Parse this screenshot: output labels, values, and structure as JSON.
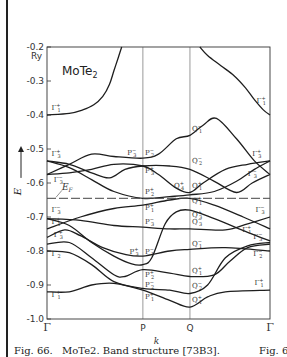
{
  "chart_data": {
    "type": "line",
    "title": "MoTe2",
    "title_main": "MoTe",
    "title_sub": "2",
    "xlabel": "k",
    "ylabel": "E",
    "yunit": "Ry",
    "ylim": [
      -1.0,
      -0.2
    ],
    "yticks": [
      -0.2,
      -0.3,
      -0.4,
      -0.5,
      -0.6,
      -0.7,
      -0.8,
      -0.9,
      -1.0
    ],
    "ytick_labels": [
      "-0.2",
      "-0.3",
      "-0.4",
      "-0.5",
      "-0.6",
      "-0.7",
      "-0.8",
      "-0.9",
      "-1.0"
    ],
    "x_symmetry_points": [
      {
        "label": "Γ",
        "k": 0.0
      },
      {
        "label": "P",
        "k": 0.43
      },
      {
        "label": "Q",
        "k": 0.641
      },
      {
        "label": "Γ",
        "k": 1.0
      }
    ],
    "fermi_level": {
      "label": "EF",
      "label_main": "E",
      "label_sub": "F",
      "E": -0.645
    },
    "grid": false,
    "legend": null,
    "series": [
      {
        "name": "band-upper-left",
        "points": [
          [
            0,
            -0.4
          ],
          [
            0.1,
            -0.395
          ],
          [
            0.16,
            -0.385
          ],
          [
            0.21,
            -0.37
          ],
          [
            0.25,
            -0.345
          ],
          [
            0.28,
            -0.31
          ],
          [
            0.3,
            -0.27
          ],
          [
            0.32,
            -0.23
          ],
          [
            0.335,
            -0.2
          ]
        ]
      },
      {
        "name": "band-upper-right",
        "points": [
          [
            0.685,
            -0.2
          ],
          [
            0.72,
            -0.225
          ],
          [
            0.78,
            -0.255
          ],
          [
            0.84,
            -0.285
          ],
          [
            0.89,
            -0.32
          ],
          [
            0.93,
            -0.355
          ],
          [
            0.97,
            -0.385
          ],
          [
            1.0,
            -0.4
          ]
        ]
      },
      {
        "name": "band-1",
        "points": [
          [
            0,
            -0.575
          ],
          [
            0.1,
            -0.545
          ],
          [
            0.2,
            -0.515
          ],
          [
            0.3,
            -0.522
          ],
          [
            0.43,
            -0.527
          ],
          [
            0.5,
            -0.515
          ],
          [
            0.58,
            -0.47
          ],
          [
            0.641,
            -0.46
          ],
          [
            0.7,
            -0.43
          ],
          [
            0.76,
            -0.41
          ],
          [
            0.85,
            -0.47
          ],
          [
            0.93,
            -0.535
          ],
          [
            1.0,
            -0.575
          ]
        ]
      },
      {
        "name": "band-2",
        "points": [
          [
            0,
            -0.535
          ],
          [
            0.1,
            -0.545
          ],
          [
            0.2,
            -0.57
          ],
          [
            0.28,
            -0.585
          ],
          [
            0.35,
            -0.56
          ],
          [
            0.43,
            -0.55
          ],
          [
            0.55,
            -0.55
          ],
          [
            0.641,
            -0.56
          ],
          [
            0.75,
            -0.595
          ],
          [
            0.85,
            -0.628
          ],
          [
            0.92,
            -0.6
          ],
          [
            1.0,
            -0.575
          ]
        ]
      },
      {
        "name": "band-3",
        "points": [
          [
            0,
            -0.535
          ],
          [
            0.1,
            -0.555
          ],
          [
            0.2,
            -0.59
          ],
          [
            0.3,
            -0.625
          ],
          [
            0.43,
            -0.645
          ],
          [
            0.55,
            -0.64
          ],
          [
            0.641,
            -0.635
          ],
          [
            0.75,
            -0.625
          ],
          [
            0.85,
            -0.595
          ],
          [
            0.93,
            -0.56
          ],
          [
            1.0,
            -0.535
          ]
        ]
      },
      {
        "name": "band-4",
        "points": [
          [
            0,
            -0.575
          ],
          [
            0.1,
            -0.57
          ],
          [
            0.2,
            -0.56
          ],
          [
            0.3,
            -0.545
          ],
          [
            0.43,
            -0.55
          ],
          [
            0.5,
            -0.575
          ],
          [
            0.58,
            -0.615
          ],
          [
            0.641,
            -0.628
          ],
          [
            0.7,
            -0.6
          ],
          [
            0.8,
            -0.56
          ],
          [
            0.9,
            -0.545
          ],
          [
            1.0,
            -0.535
          ]
        ]
      },
      {
        "name": "band-5",
        "points": [
          [
            0,
            -0.735
          ],
          [
            0.15,
            -0.7
          ],
          [
            0.3,
            -0.675
          ],
          [
            0.43,
            -0.665
          ],
          [
            0.55,
            -0.65
          ],
          [
            0.641,
            -0.645
          ],
          [
            0.75,
            -0.665
          ],
          [
            0.88,
            -0.7
          ],
          [
            1.0,
            -0.735
          ]
        ]
      },
      {
        "name": "band-6",
        "points": [
          [
            0,
            -0.705
          ],
          [
            0.15,
            -0.71
          ],
          [
            0.3,
            -0.725
          ],
          [
            0.43,
            -0.73
          ],
          [
            0.55,
            -0.735
          ],
          [
            0.641,
            -0.735
          ],
          [
            0.8,
            -0.738
          ],
          [
            0.9,
            -0.72
          ],
          [
            1.0,
            -0.7
          ]
        ]
      },
      {
        "name": "band-7",
        "points": [
          [
            0,
            -0.705
          ],
          [
            0.1,
            -0.725
          ],
          [
            0.2,
            -0.775
          ],
          [
            0.3,
            -0.815
          ],
          [
            0.38,
            -0.838
          ],
          [
            0.43,
            -0.84
          ],
          [
            0.47,
            -0.82
          ],
          [
            0.53,
            -0.72
          ],
          [
            0.58,
            -0.685
          ],
          [
            0.641,
            -0.68
          ],
          [
            0.75,
            -0.705
          ],
          [
            0.9,
            -0.745
          ],
          [
            1.0,
            -0.77
          ]
        ]
      },
      {
        "name": "band-8",
        "points": [
          [
            0,
            -0.76
          ],
          [
            0.08,
            -0.738
          ],
          [
            0.15,
            -0.755
          ],
          [
            0.25,
            -0.79
          ],
          [
            0.35,
            -0.81
          ],
          [
            0.43,
            -0.815
          ],
          [
            0.55,
            -0.8
          ],
          [
            0.641,
            -0.795
          ],
          [
            0.8,
            -0.79
          ],
          [
            1.0,
            -0.8
          ]
        ]
      },
      {
        "name": "band-9",
        "points": [
          [
            0,
            -0.78
          ],
          [
            0.1,
            -0.775
          ],
          [
            0.2,
            -0.82
          ],
          [
            0.3,
            -0.87
          ],
          [
            0.35,
            -0.875
          ],
          [
            0.43,
            -0.855
          ],
          [
            0.55,
            -0.865
          ],
          [
            0.641,
            -0.875
          ],
          [
            0.75,
            -0.87
          ],
          [
            0.82,
            -0.83
          ],
          [
            0.9,
            -0.79
          ],
          [
            1.0,
            -0.78
          ]
        ]
      },
      {
        "name": "band-10",
        "points": [
          [
            0,
            -0.8
          ],
          [
            0.1,
            -0.805
          ],
          [
            0.2,
            -0.84
          ],
          [
            0.3,
            -0.89
          ],
          [
            0.43,
            -0.91
          ],
          [
            0.55,
            -0.915
          ],
          [
            0.641,
            -0.925
          ],
          [
            0.72,
            -0.9
          ],
          [
            0.8,
            -0.82
          ],
          [
            0.9,
            -0.785
          ],
          [
            1.0,
            -0.775
          ]
        ]
      },
      {
        "name": "band-11",
        "points": [
          [
            0,
            -0.92
          ],
          [
            0.1,
            -0.92
          ],
          [
            0.2,
            -0.9
          ],
          [
            0.3,
            -0.895
          ],
          [
            0.43,
            -0.915
          ],
          [
            0.55,
            -0.945
          ],
          [
            0.641,
            -0.965
          ],
          [
            0.72,
            -0.935
          ],
          [
            0.8,
            -0.92
          ],
          [
            1.0,
            -0.915
          ]
        ]
      }
    ],
    "annotations": [
      {
        "sym": "Γ",
        "sub": "1",
        "sup": "+",
        "k": 0.02,
        "E": -0.385
      },
      {
        "sym": "Γ",
        "sub": "1",
        "sup": "+",
        "k": 0.94,
        "E": -0.365
      },
      {
        "sym": "Γ",
        "sub": "3",
        "sup": "+",
        "k": 0.02,
        "E": -0.522
      },
      {
        "sym": "Γ",
        "sub": "3",
        "sup": "−",
        "k": 0.03,
        "E": -0.598
      },
      {
        "sym": "Γ",
        "sub": "3",
        "sup": "+",
        "k": 0.92,
        "E": -0.522
      },
      {
        "sym": "Γ",
        "sub": "3",
        "sup": "−",
        "k": 0.9,
        "E": -0.58
      },
      {
        "sym": "P",
        "sub": "3",
        "sup": "−",
        "k": 0.36,
        "E": -0.518
      },
      {
        "sym": "P",
        "sub": "2",
        "sup": "−",
        "k": 0.44,
        "E": -0.518
      },
      {
        "sym": "P",
        "sub": "3",
        "sup": "+",
        "k": 0.44,
        "E": -0.57
      },
      {
        "sym": "P",
        "sub": "2",
        "sup": "+",
        "k": 0.44,
        "E": -0.633
      },
      {
        "sym": "Q",
        "sub": "1",
        "sup": "−",
        "k": 0.65,
        "E": -0.448
      },
      {
        "sym": "Q",
        "sub": "2",
        "sup": "−",
        "k": 0.65,
        "E": -0.54
      },
      {
        "sym": "Q",
        "sub": "4",
        "sup": "+",
        "k": 0.57,
        "E": -0.615
      },
      {
        "sym": "Q",
        "sub": "1",
        "sup": "+",
        "k": 0.65,
        "E": -0.615
      },
      {
        "sym": "Γ",
        "sub": "3",
        "sup": "−",
        "k": 0.02,
        "E": -0.685
      },
      {
        "sym": "Γ",
        "sub": "1",
        "sup": "+",
        "k": 0.02,
        "E": -0.722
      },
      {
        "sym": "Γ",
        "sub": "3",
        "sup": "+",
        "k": 0.03,
        "E": -0.758
      },
      {
        "sym": "Γ",
        "sub": "2",
        "sup": "−",
        "k": 0.02,
        "E": -0.815
      },
      {
        "sym": "Γ",
        "sub": "1",
        "sup": "+",
        "k": 0.02,
        "E": -0.935
      },
      {
        "sym": "P",
        "sub": "1",
        "sup": "+",
        "k": 0.44,
        "E": -0.68
      },
      {
        "sym": "P",
        "sub": "3",
        "sup": "−",
        "k": 0.44,
        "E": -0.722
      },
      {
        "sym": "P",
        "sub": "3",
        "sup": "+",
        "k": 0.37,
        "E": -0.81
      },
      {
        "sym": "P",
        "sub": "1",
        "sup": "−",
        "k": 0.44,
        "E": -0.81
      },
      {
        "sym": "P",
        "sub": "2",
        "sup": "+",
        "k": 0.44,
        "E": -0.875
      },
      {
        "sym": "P",
        "sub": "2",
        "sup": "−",
        "k": 0.44,
        "E": -0.905
      },
      {
        "sym": "P",
        "sub": "1",
        "sup": "+",
        "k": 0.44,
        "E": -0.94
      },
      {
        "sym": "Q",
        "sub": "1",
        "sup": "+",
        "k": 0.65,
        "E": -0.66
      },
      {
        "sym": "Q",
        "sub": "3",
        "sup": "+",
        "k": 0.65,
        "E": -0.7
      },
      {
        "sym": "Q",
        "sub": "3",
        "sup": "−",
        "k": 0.65,
        "E": -0.72
      },
      {
        "sym": "Q",
        "sub": "1",
        "sup": "−",
        "k": 0.65,
        "E": -0.785
      },
      {
        "sym": "Q",
        "sub": "1",
        "sup": "+",
        "k": 0.65,
        "E": -0.865
      },
      {
        "sym": "Q",
        "sub": "2",
        "sup": "−",
        "k": 0.65,
        "E": -0.91
      },
      {
        "sym": "Q",
        "sub": "1",
        "sup": "+",
        "k": 0.65,
        "E": -0.95
      },
      {
        "sym": "Γ",
        "sub": "3",
        "sup": "−",
        "k": 0.935,
        "E": -0.685
      },
      {
        "sym": "Γ",
        "sub": "1",
        "sup": "+",
        "k": 0.875,
        "E": -0.745
      },
      {
        "sym": "Γ",
        "sub": "3",
        "sup": "−",
        "k": 0.925,
        "E": -0.765
      },
      {
        "sym": "Γ",
        "sub": "2",
        "sup": "−",
        "k": 0.925,
        "E": -0.815
      },
      {
        "sym": "Γ",
        "sub": "1",
        "sup": "+",
        "k": 0.93,
        "E": -0.9
      }
    ]
  },
  "caption": {
    "figure": "Fig. 66.",
    "text": "MoTe2. Band structure [73B3].",
    "right": "Fig. 68"
  },
  "axis": {
    "ylabel": "E",
    "unit": "Ry",
    "xlabel": "k"
  }
}
